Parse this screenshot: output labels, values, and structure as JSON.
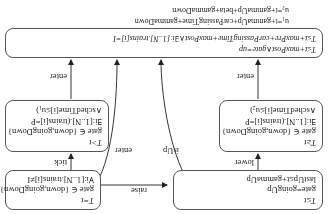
{
  "diagram": {
    "type": "state-machine",
    "orientation": "rotated-180",
    "nodes": {
      "init": {
        "lines": [
          "T=t",
          "gate ∈ {down,goingDown}",
          "∀i:[1..N].trains[i]≠I"
        ]
      },
      "goingUp": {
        "lines": [
          "T≤t",
          "gate=goingUp",
          "lastUp≤t+gammaUp"
        ]
      },
      "waitA": {
        "lines": [
          "T>t",
          "gate ∈ {down,goingDown}",
          "∃i:[1..N].(trains[i]=P",
          "∧schedTime[i]≤u₁)"
        ]
      },
      "waitB": {
        "lines": [
          "T≥t",
          "gate ∈ {down,goingDown}",
          "∃i:[1..N].(trains[i]=P",
          "∧schedTime[i]≤u₂)"
        ]
      },
      "top": {
        "lines": [
          "T≤t+maxPost∧gate=up",
          "T≤t+maxPre+carPassingTime+maxPost∧∃i:[1..N].trains[i]=I"
        ]
      }
    },
    "definitions": [
      "u₁=t+gammaUp+carPassingTime+gammaDown",
      "u₂=t+gammaUp+beta+gammaDown"
    ],
    "edges": [
      {
        "from": "init",
        "to": "waitA",
        "label": "tick"
      },
      {
        "from": "init",
        "to": "goingUp",
        "label": "raise"
      },
      {
        "from": "init",
        "to": "top",
        "label": "enter"
      },
      {
        "from": "goingUp",
        "to": "waitB",
        "label": "lower"
      },
      {
        "from": "goingUp",
        "to": "top",
        "label": "isUp"
      },
      {
        "from": "waitA",
        "to": "top",
        "label": "enter"
      },
      {
        "from": "waitB",
        "to": "top",
        "label": "enter"
      }
    ]
  }
}
